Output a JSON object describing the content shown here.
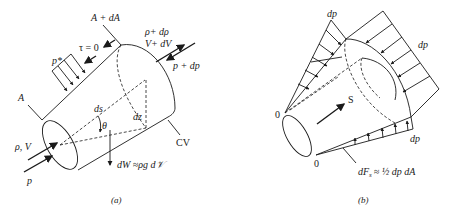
{
  "figure_a": {
    "caption": "(a)",
    "labels": {
      "area_in": "A",
      "area_out": "A + dA",
      "shear": "τ = 0",
      "pressure_side": "p*",
      "inlet_props": "ρ, V",
      "inlet_pressure": "p",
      "outlet_density": "ρ+ dρ",
      "outlet_velocity": "V+ dV",
      "outlet_pressure": "p + dp",
      "length": "ds",
      "angle": "θ",
      "height": "dz",
      "control_volume": "CV",
      "weight": "dW ≈ρg d𝒱"
    }
  },
  "figure_b": {
    "caption": "(b)",
    "labels": {
      "dp_top": "dp",
      "dp_right": "dp",
      "dp_bottom": "dp",
      "origin_top": "0",
      "origin_bottom": "0",
      "direction": "S",
      "force": "dF",
      "force_sub": "s",
      "force_eq": "≈ ½ dp dA"
    }
  }
}
